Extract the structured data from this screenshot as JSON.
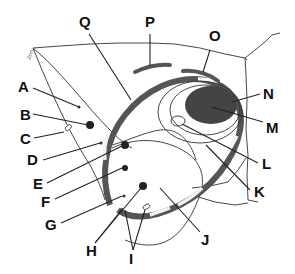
{
  "diagram": {
    "type": "labeled-anatomical-diagram",
    "scale_bar_text": "2cm",
    "labels": [
      {
        "id": "A",
        "text": "A",
        "x": 18,
        "y": 90
      },
      {
        "id": "B",
        "text": "B",
        "x": 20,
        "y": 119
      },
      {
        "id": "C",
        "text": "C",
        "x": 20,
        "y": 144
      },
      {
        "id": "D",
        "text": "D",
        "x": 27,
        "y": 165
      },
      {
        "id": "E",
        "text": "E",
        "x": 33,
        "y": 189
      },
      {
        "id": "F",
        "text": "F",
        "x": 41,
        "y": 207
      },
      {
        "id": "G",
        "text": "G",
        "x": 45,
        "y": 230
      },
      {
        "id": "H",
        "text": "H",
        "x": 86,
        "y": 254
      },
      {
        "id": "I",
        "text": "I",
        "x": 128,
        "y": 262
      },
      {
        "id": "J",
        "text": "J",
        "x": 202,
        "y": 243
      },
      {
        "id": "K",
        "text": "K",
        "x": 253,
        "y": 197
      },
      {
        "id": "L",
        "text": "L",
        "x": 261,
        "y": 170
      },
      {
        "id": "M",
        "text": "M",
        "x": 266,
        "y": 135
      },
      {
        "id": "N",
        "text": "N",
        "x": 263,
        "y": 108
      },
      {
        "id": "O",
        "text": "O",
        "x": 210,
        "y": 43
      },
      {
        "id": "P",
        "text": "P",
        "x": 145,
        "y": 28
      },
      {
        "id": "Q",
        "text": "Q",
        "x": 79,
        "y": 28
      }
    ]
  },
  "colors": {
    "line": "#333333",
    "band_dark": "#555555",
    "band_light": "#f2f2f2",
    "mass_fill": "#444444",
    "label": "#111111"
  }
}
